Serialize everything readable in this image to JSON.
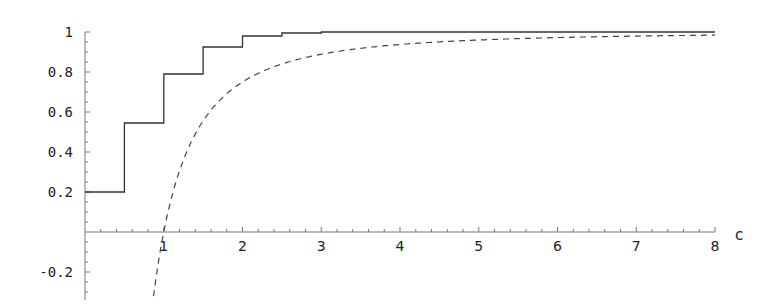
{
  "chart_data": {
    "type": "line",
    "title": "",
    "xlabel": "c",
    "ylabel": "",
    "xlim": [
      0,
      8
    ],
    "ylim": [
      -0.3,
      1.0
    ],
    "grid": false,
    "legend": null,
    "x_ticks": [
      1,
      2,
      3,
      4,
      5,
      6,
      7,
      8
    ],
    "x_tick_labels": [
      "1",
      "2",
      "3",
      "4",
      "5",
      "6",
      "7",
      "8"
    ],
    "y_ticks": [
      -0.2,
      0.2,
      0.4,
      0.6,
      0.8,
      1
    ],
    "y_tick_labels": [
      "-0.2",
      "0.2",
      "0.4",
      "0.6",
      "0.8",
      "1"
    ],
    "series": [
      {
        "name": "step function",
        "style": "solid",
        "kind": "step",
        "x": [
          0,
          0.5,
          0.5,
          1.0,
          1.0,
          1.5,
          1.5,
          2.0,
          2.0,
          2.5,
          2.5,
          3.0,
          3.0,
          8.0
        ],
        "y": [
          0.2,
          0.2,
          0.545,
          0.545,
          0.79,
          0.79,
          0.925,
          0.925,
          0.98,
          0.98,
          0.995,
          0.995,
          1.0,
          1.0
        ]
      },
      {
        "name": "1 - 1/c^2",
        "style": "dashed",
        "kind": "curve",
        "x": [
          0.87,
          1.0,
          1.25,
          1.5,
          2.0,
          2.5,
          3.0,
          4.0,
          5.0,
          6.0,
          7.0,
          8.0
        ],
        "y": [
          -0.32,
          0.0,
          0.36,
          0.556,
          0.75,
          0.84,
          0.889,
          0.9375,
          0.96,
          0.972,
          0.98,
          0.984
        ]
      }
    ]
  },
  "axes": {
    "x_label": "c",
    "y_labels": [
      "1",
      "0.8",
      "0.6",
      "0.4",
      "0.2",
      "-0.2"
    ],
    "x_labels": [
      "1",
      "2",
      "3",
      "4",
      "5",
      "6",
      "7",
      "8"
    ]
  }
}
